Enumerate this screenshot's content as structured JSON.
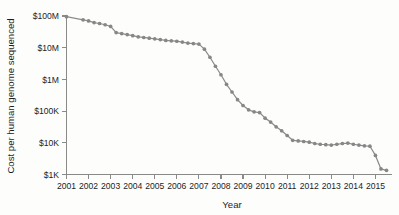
{
  "figure": {
    "background_color": "#fdfdfc",
    "line_color": "#8c8c8c",
    "marker_color": "#878787",
    "axis_color": "#8a8a8a",
    "text_color": "#1d1d1d"
  },
  "chart_data": {
    "type": "line",
    "title": "",
    "xlabel": "Year",
    "ylabel": "Cost per human genome sequenced",
    "yscale": "log",
    "ylim": [
      1000,
      100000000
    ],
    "xlim": [
      2001,
      2015.75
    ],
    "grid": false,
    "legend": null,
    "ytick_labels": [
      "$100M",
      "$10M",
      "$1M",
      "$100K",
      "$10K",
      "$1K"
    ],
    "ytick_values": [
      100000000,
      10000000,
      1000000,
      100000,
      10000,
      1000
    ],
    "xtick_labels": [
      "2001",
      "2002",
      "2003",
      "2004",
      "2005",
      "2006",
      "2007",
      "2008",
      "2009",
      "2010",
      "2011",
      "2012",
      "2013",
      "2014",
      "2015"
    ],
    "xtick_values": [
      2001,
      2002,
      2003,
      2004,
      2005,
      2006,
      2007,
      2008,
      2009,
      2010,
      2011,
      2012,
      2013,
      2014,
      2015
    ],
    "series": [
      {
        "name": "Cost per human genome sequenced",
        "x": [
          2001.0,
          2001.75,
          2002.0,
          2002.25,
          2002.5,
          2002.75,
          2003.0,
          2003.25,
          2003.5,
          2003.75,
          2004.0,
          2004.25,
          2004.5,
          2004.75,
          2005.0,
          2005.25,
          2005.5,
          2005.75,
          2006.0,
          2006.25,
          2006.5,
          2006.75,
          2007.0,
          2007.25,
          2007.5,
          2007.75,
          2008.0,
          2008.25,
          2008.5,
          2008.75,
          2009.0,
          2009.25,
          2009.5,
          2009.75,
          2010.0,
          2010.25,
          2010.5,
          2010.75,
          2011.0,
          2011.25,
          2011.5,
          2011.75,
          2012.0,
          2012.25,
          2012.5,
          2012.75,
          2013.0,
          2013.25,
          2013.5,
          2013.75,
          2014.0,
          2014.25,
          2014.5,
          2014.75,
          2015.0,
          2015.25,
          2015.5
        ],
        "y": [
          95000000,
          76000000,
          70000000,
          62000000,
          58000000,
          53000000,
          47000000,
          30000000,
          28000000,
          26000000,
          24000000,
          22000000,
          21000000,
          20000000,
          19000000,
          18000000,
          17000000,
          16500000,
          16000000,
          15000000,
          14000000,
          13500000,
          13000000,
          9000000,
          5000000,
          2600000,
          1400000,
          700000,
          400000,
          230000,
          150000,
          110000,
          95000,
          90000,
          60000,
          45000,
          32000,
          24000,
          17000,
          12000,
          11500,
          11000,
          10500,
          9500,
          9000,
          8700,
          8500,
          9000,
          9500,
          9800,
          9000,
          8500,
          8000,
          7800,
          4000,
          1500,
          1350
        ]
      }
    ]
  }
}
